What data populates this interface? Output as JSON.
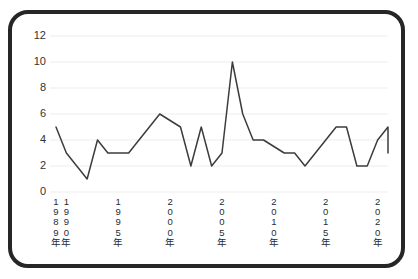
{
  "chart_data": {
    "type": "line",
    "title": "",
    "subtitle": "",
    "xlabel": "",
    "ylabel": "",
    "grid": true,
    "legend": "none",
    "ylim": [
      0,
      12
    ],
    "ytick_labels": [
      "0",
      "2",
      "4",
      "6",
      "8",
      "10",
      "12"
    ],
    "ytick_values": [
      0,
      2,
      4,
      6,
      8,
      10,
      12
    ],
    "xtick_labels": [
      "1989年",
      "1990年",
      "1995年",
      "2000年",
      "2005年",
      "2010年",
      "2015年",
      "2020年"
    ],
    "xtick_values": [
      1989,
      1990,
      1995,
      2000,
      2005,
      2010,
      2015,
      2020
    ],
    "xlim": [
      1989,
      2021
    ],
    "x": [
      1989,
      1990,
      1991,
      1992,
      1993,
      1994,
      1995,
      1996,
      1997,
      1998,
      1999,
      2000,
      2001,
      2002,
      2003,
      2004,
      2005,
      2006,
      2007,
      2008,
      2009,
      2010,
      2011,
      2012,
      2013,
      2014,
      2015,
      2016,
      2017,
      2018,
      2019,
      2020,
      2021
    ],
    "values": [
      5,
      3,
      2,
      1,
      4,
      3,
      3,
      3,
      4,
      5,
      6,
      5.5,
      5,
      2,
      5,
      2,
      3,
      10,
      6,
      4,
      4,
      3.5,
      3,
      3,
      2,
      3,
      4,
      5,
      5,
      2,
      2,
      4,
      5
    ],
    "series": [
      {
        "name": "series-1",
        "color": "#3c3c3c",
        "values": [
          5,
          3,
          2,
          1,
          4,
          3,
          3,
          3,
          4,
          5,
          6,
          5.5,
          5,
          2,
          5,
          2,
          3,
          10,
          6,
          4,
          4,
          3.5,
          3,
          3,
          2,
          3,
          4,
          5,
          5,
          2,
          2,
          4,
          5
        ]
      }
    ],
    "tail_values": [
      4,
      3,
      3
    ],
    "colors": {
      "line": "#3c3c3c",
      "grid": "#eeeeee",
      "axis_text": "#333333",
      "frame": "#262626",
      "background": "#ffffff"
    }
  }
}
